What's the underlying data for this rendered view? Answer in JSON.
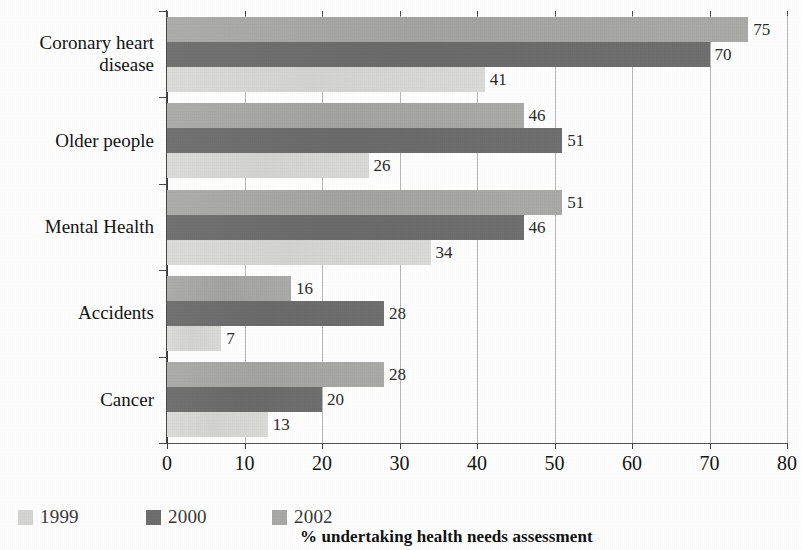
{
  "chart_data": {
    "type": "bar",
    "orientation": "horizontal",
    "title": "",
    "subtitle": "",
    "xlabel": "% undertaking health needs assessment",
    "ylabel": "",
    "xlim": [
      0,
      80
    ],
    "xticks": [
      0,
      10,
      20,
      30,
      40,
      50,
      60,
      70,
      80
    ],
    "xtick_labels": [
      "0",
      "10",
      "20",
      "30",
      "40",
      "50",
      "60",
      "70",
      "80"
    ],
    "grid": "vertical",
    "legend_position": "bottom-left",
    "categories": [
      "Coronary heart disease",
      "Older people",
      "Mental Health",
      "Accidents",
      "Cancer"
    ],
    "category_label_lines": [
      [
        "Coronary heart",
        "disease"
      ],
      [
        "Older people"
      ],
      [
        "Mental Health"
      ],
      [
        "Accidents"
      ],
      [
        "Cancer"
      ]
    ],
    "series": [
      {
        "name": "1999",
        "color": "#d5d5d3",
        "values": [
          41,
          26,
          34,
          7,
          13
        ]
      },
      {
        "name": "2000",
        "color": "#6e6e6e",
        "values": [
          70,
          51,
          46,
          28,
          20
        ]
      },
      {
        "name": "2002",
        "color": "#a8a8a6",
        "values": [
          75,
          46,
          51,
          16,
          28
        ]
      }
    ],
    "series_draw_order_top_to_bottom": [
      "2002",
      "2000",
      "1999"
    ],
    "data_labels": {
      "Coronary heart disease": {
        "2002": "75",
        "2000": "70",
        "1999": "41"
      },
      "Older people": {
        "2002": "46",
        "2000": "51",
        "1999": "26"
      },
      "Mental Health": {
        "2002": "51",
        "2000": "46",
        "1999": "34"
      },
      "Accidents": {
        "2002": "16",
        "2000": "28",
        "1999": "7"
      },
      "Cancer": {
        "2002": "28",
        "2000": "20",
        "1999": "13"
      }
    }
  },
  "legend": {
    "items": [
      {
        "label": "1999",
        "color": "#d5d5d3",
        "key": "s1999"
      },
      {
        "label": "2000",
        "color": "#6e6e6e",
        "key": "s2000"
      },
      {
        "label": "2002",
        "color": "#a8a8a6",
        "key": "s2002"
      }
    ]
  },
  "axis_title": "% undertaking health needs assessment"
}
